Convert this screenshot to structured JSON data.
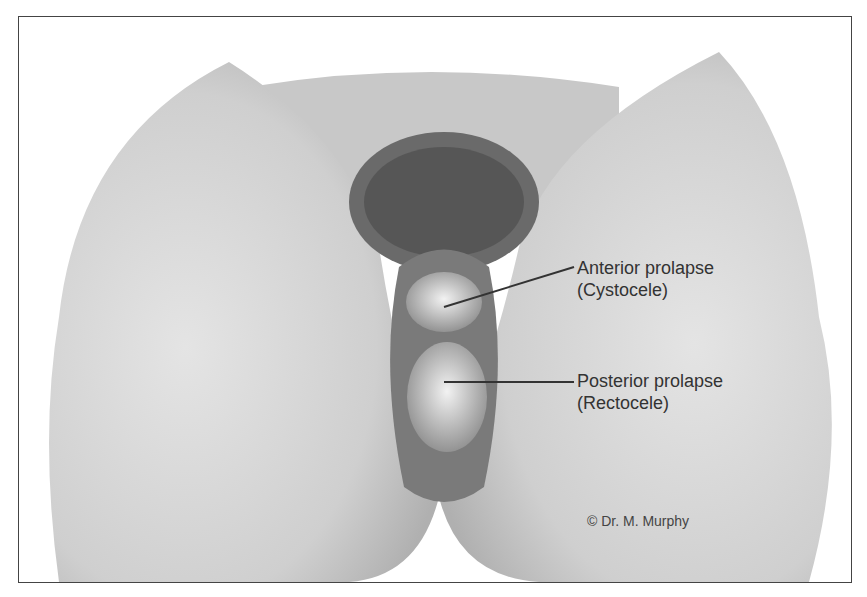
{
  "figure": {
    "labels": [
      {
        "line1": "Anterior prolapse",
        "line2": "(Cystocele)"
      },
      {
        "line1": "Posterior prolapse",
        "line2": "(Rectocele)"
      }
    ],
    "copyright": "© Dr. M. Murphy"
  }
}
